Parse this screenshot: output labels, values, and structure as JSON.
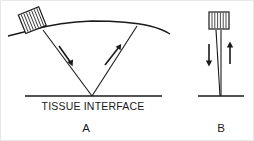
{
  "figure": {
    "background_color": "#ffffff",
    "line_color": "#1a1a1a",
    "width": 254,
    "height": 141
  },
  "labels": {
    "tissue_interface": "TISSUE INTERFACE",
    "panel_a": "A",
    "panel_b": "B"
  },
  "panel_a": {
    "name": "A",
    "transducer": {
      "name": "transducer-a",
      "orientation": "tilted",
      "tilt_degrees": -22,
      "hatch_pattern": "vertical-lines",
      "hatch_count": 7
    },
    "skin_surface": {
      "name": "curved-skin-surface",
      "shape": "convex-arc"
    },
    "beam": {
      "shape": "V",
      "apex_on_interface": true,
      "transmit_label": "down-arrow",
      "receive_label": "up-arrow"
    },
    "arrows": [
      {
        "name": "transmit-arrow",
        "direction": "down-right"
      },
      {
        "name": "receive-arrow",
        "direction": "up-right"
      }
    ],
    "interface": {
      "name": "tissue-interface-line-a"
    }
  },
  "panel_b": {
    "name": "B",
    "transducer": {
      "name": "transducer-b",
      "orientation": "upright",
      "tilt_degrees": 0,
      "hatch_pattern": "vertical-lines",
      "hatch_count": 6
    },
    "beam": {
      "shape": "narrow-vertical",
      "apex_on_interface": true
    },
    "arrows": [
      {
        "name": "transmit-arrow",
        "direction": "down"
      },
      {
        "name": "receive-arrow",
        "direction": "up"
      }
    ],
    "interface": {
      "name": "tissue-interface-line-b"
    }
  }
}
